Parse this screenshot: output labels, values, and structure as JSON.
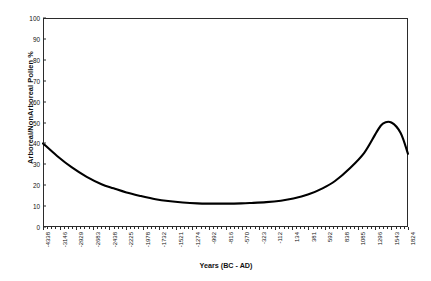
{
  "chart_data": {
    "type": "line",
    "title": "",
    "xlabel": "Years (BC - AD)",
    "ylabel": "Arboreal/NonArboreal Pollen %",
    "ylim": [
      0,
      100
    ],
    "ytick_values": [
      0,
      10,
      20,
      30,
      40,
      50,
      60,
      70,
      80,
      90,
      100
    ],
    "ytick_labels": [
      "0",
      "10",
      "20",
      "30",
      "40",
      "50",
      "60",
      "70",
      "80",
      "90",
      "100"
    ],
    "xlim": [
      -4338,
      1824
    ],
    "grid": false,
    "legend": null,
    "xtick_labels": [
      "-4338",
      "-3146",
      "-2929",
      "-2683",
      "-2438",
      "-2225",
      "-1978",
      "-1732",
      "-1521",
      "-1274",
      "-992",
      "-816",
      "-570",
      "-323",
      "-112",
      "134",
      "381",
      "592",
      "838",
      "1085",
      "1296",
      "1543",
      "1824"
    ],
    "series": [
      {
        "name": "Arboreal/NonArboreal Pollen %",
        "color": "#000000",
        "x": [
          -4338,
          -4100,
          -3850,
          -3600,
          -3350,
          -3146,
          -2929,
          -2683,
          -2438,
          -2225,
          -1978,
          -1732,
          -1521,
          -1274,
          -992,
          -816,
          -570,
          -323,
          -112,
          134,
          381,
          592,
          838,
          1085,
          1296,
          1400,
          1543,
          1700,
          1824
        ],
        "y": [
          40.0,
          34.0,
          28.5,
          24.0,
          20.5,
          18.5,
          16.5,
          14.8,
          13.3,
          12.4,
          11.7,
          11.3,
          11.2,
          11.2,
          11.3,
          11.5,
          11.9,
          12.6,
          13.6,
          15.5,
          18.5,
          22.0,
          28.0,
          35.5,
          45.5,
          49.5,
          50.0,
          45.0,
          35.0
        ]
      }
    ]
  }
}
